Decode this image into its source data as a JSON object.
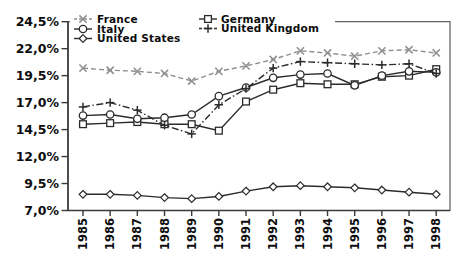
{
  "chart_data": {
    "type": "line",
    "title": "",
    "xlabel": "",
    "ylabel": "",
    "grid": false,
    "legend_position": "top-inside",
    "decimal_separator": ",",
    "categories": [
      "1985",
      "1986",
      "1987",
      "1988",
      "1989",
      "1990",
      "1991",
      "1992",
      "1993",
      "1994",
      "1995",
      "1996",
      "1997",
      "1998"
    ],
    "ylim": [
      7.0,
      24.5
    ],
    "y_ticks": [
      {
        "value": 24.5,
        "label": "24,5%"
      },
      {
        "value": 22.0,
        "label": "22,0%"
      },
      {
        "value": 19.5,
        "label": "19,5%"
      },
      {
        "value": 17.0,
        "label": "17,0%"
      },
      {
        "value": 14.5,
        "label": "14,5%"
      },
      {
        "value": 12.0,
        "label": "12,0%"
      },
      {
        "value": 9.5,
        "label": "9,5%"
      },
      {
        "value": 7.0,
        "label": "7,0%"
      }
    ],
    "series": [
      {
        "name": "France",
        "marker": "x",
        "line": "dashed",
        "color": "#8f8f8f",
        "values": [
          20.2,
          20.0,
          19.9,
          19.7,
          19.0,
          19.9,
          20.4,
          21.0,
          21.8,
          21.6,
          21.3,
          21.8,
          21.9,
          21.6
        ]
      },
      {
        "name": "Germany",
        "marker": "square",
        "line": "solid",
        "color": "#2b2b2b",
        "values": [
          15.0,
          15.1,
          15.2,
          15.0,
          15.0,
          14.4,
          17.1,
          18.2,
          18.8,
          18.7,
          18.7,
          19.4,
          19.5,
          20.1
        ]
      },
      {
        "name": "Italy",
        "marker": "circle",
        "line": "solid",
        "color": "#2b2b2b",
        "values": [
          15.8,
          15.9,
          15.5,
          15.6,
          15.9,
          17.6,
          18.4,
          19.3,
          19.6,
          19.7,
          18.6,
          19.5,
          19.9,
          19.8
        ]
      },
      {
        "name": "United Kingdom",
        "marker": "plus",
        "line": "dashdot",
        "color": "#2b2b2b",
        "values": [
          16.6,
          17.0,
          16.3,
          14.9,
          14.1,
          16.8,
          18.3,
          20.2,
          20.8,
          20.7,
          20.6,
          20.5,
          20.6,
          19.7
        ]
      },
      {
        "name": "United States",
        "marker": "diamond",
        "line": "solid",
        "color": "#2b2b2b",
        "values": [
          8.5,
          8.5,
          8.4,
          8.2,
          8.1,
          8.3,
          8.8,
          9.2,
          9.3,
          9.2,
          9.1,
          8.9,
          8.7,
          8.5
        ]
      }
    ],
    "legend_columns": [
      [
        "France",
        "Italy",
        "United States"
      ],
      [
        "Germany",
        "United Kingdom"
      ]
    ]
  },
  "frame": {
    "background": "#ffffff",
    "axis_color": "#3a3a3a",
    "label_color": "#0d0d0d"
  }
}
